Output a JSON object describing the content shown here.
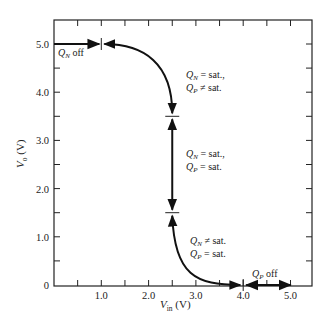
{
  "chart_data": {
    "type": "line",
    "title": "",
    "xlabel": "V_in (V)",
    "ylabel": "V_o (V)",
    "xlim": [
      0,
      5.5
    ],
    "ylim": [
      0,
      5.5
    ],
    "grid": false,
    "x_ticks": [
      0.5,
      1.0,
      1.5,
      2.0,
      2.5,
      3.0,
      3.5,
      4.0,
      4.5,
      5.0
    ],
    "x_tick_labels": [
      "1.0",
      "2.0",
      "3.0",
      "4.0",
      "5.0"
    ],
    "y_ticks": [
      0.5,
      1.0,
      1.5,
      2.0,
      2.5,
      3.0,
      3.5,
      4.0,
      4.5,
      5.0
    ],
    "y_tick_labels": [
      "0",
      "1.0",
      "2.0",
      "3.0",
      "4.0",
      "5.0"
    ],
    "series": [
      {
        "name": "Voltage transfer characteristic",
        "x": [
          0.0,
          1.0,
          1.5,
          2.0,
          2.3,
          2.45,
          2.5,
          2.5,
          2.55,
          2.7,
          3.0,
          3.5,
          4.0,
          5.0
        ],
        "y": [
          5.0,
          5.0,
          4.95,
          4.75,
          4.35,
          3.9,
          3.5,
          1.5,
          1.05,
          0.6,
          0.25,
          0.05,
          0.0,
          0.0
        ]
      }
    ],
    "region_boundaries": [
      {
        "x": 1.0,
        "y": 5.0
      },
      {
        "x": 2.5,
        "y": 3.5
      },
      {
        "x": 2.5,
        "y": 1.5
      },
      {
        "x": 4.0,
        "y": 0.0
      }
    ],
    "annotations": [
      {
        "text": "Q_N off",
        "x": 0.2,
        "y": 4.75
      },
      {
        "text": "Q_N = sat., Q_P ≠ sat.",
        "x": 2.75,
        "y": 4.3
      },
      {
        "text": "Q_N = sat., Q_P = sat.",
        "x": 2.75,
        "y": 2.5
      },
      {
        "text": "Q_N ≠ sat., Q_P = sat.",
        "x": 3.1,
        "y": 0.6
      },
      {
        "text": "Q_P off",
        "x": 4.3,
        "y": 0.15
      }
    ]
  },
  "labels": {
    "x_axis_main": "V",
    "x_axis_sub": "in",
    "x_axis_unit": " (V)",
    "y_axis_main": "V",
    "y_axis_sub": "o",
    "y_axis_unit": " (V)",
    "ann_qn_off_q": "Q",
    "ann_qn_off_sub": "N",
    "ann_qn_off_rest": " off",
    "ann2_line1_rest": " = sat.,",
    "ann2_line2_rest": " ≠ sat.",
    "ann3_line1_rest": " = sat.,",
    "ann3_line2_rest": " = sat.",
    "ann4_line1_rest": " ≠ sat.",
    "ann4_line2_rest": " = sat.",
    "ann_qp_off_rest": " off",
    "q": "Q",
    "sub_n": "N",
    "sub_p": "P"
  }
}
